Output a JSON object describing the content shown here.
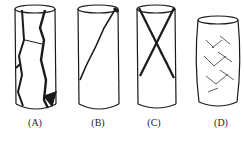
{
  "specimens": [
    {
      "label": "(A)",
      "failure": "axial splitting"
    },
    {
      "label": "(B)",
      "failure": "single shear plane"
    },
    {
      "label": "(C)",
      "failure": "conjugate shear (X-shaped)"
    },
    {
      "label": "(D)",
      "failure": "ductile / barreling with distributed shear"
    }
  ]
}
